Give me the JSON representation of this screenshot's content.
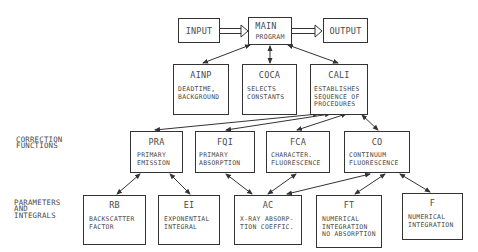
{
  "diagram": {
    "top_row": {
      "input": {
        "title": "INPUT"
      },
      "main": {
        "title": "MAIN",
        "subtitle": "PROGRAM"
      },
      "output": {
        "title": "OUTPUT"
      }
    },
    "second_row": {
      "ainp": {
        "title": "AINP",
        "desc": "DEADTIME,\nBACKGROUND"
      },
      "coca": {
        "title": "COCA",
        "desc": "SELECTS\nCONSTANTS"
      },
      "cali": {
        "title": "CALI",
        "desc": "ESTABLISHES\nSEQUENCE OF\nPROCEDURES"
      }
    },
    "row_labels": {
      "correction": "CORRECTION\nFUNCTIONS",
      "parameters": "PARAMETERS\nAND\nINTEGRALS"
    },
    "correction_functions": {
      "pra": {
        "title": "PRA",
        "desc": "PRIMARY\nEMISSION"
      },
      "fqi": {
        "title": "FQI",
        "desc": "PRIMARY\nABSORPTION"
      },
      "fca": {
        "title": "FCA",
        "desc": "CHARACTER.\nFLUORESCENCE"
      },
      "co": {
        "title": "CO",
        "desc": "CONTINUUM\nFLUORESCENCE"
      }
    },
    "parameters_integrals": {
      "rb": {
        "title": "RB",
        "desc": "BACKSCATTER\nFACTOR"
      },
      "ei": {
        "title": "EI",
        "desc": "EXPONENTIAL\nINTEGRAL"
      },
      "ac": {
        "title": "AC",
        "desc": "X-RAY ABSORP-\nTION COEFFIC."
      },
      "ft": {
        "title": "FT",
        "desc": "NUMERICAL\nINTEGRATION\nNO ABSORPTION"
      },
      "f": {
        "title": "F",
        "desc": "NUMERICAL\nINTEGRATION"
      }
    },
    "colors": {
      "line": "#333333",
      "text": "#4a4a4a",
      "background": "#ffffff"
    }
  }
}
